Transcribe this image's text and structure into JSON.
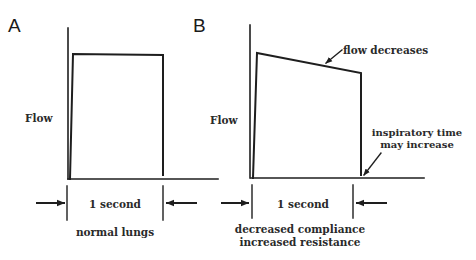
{
  "figure": {
    "panels": [
      {
        "id": "A",
        "letter": "A",
        "y_axis_label": "Flow",
        "duration_label": "1 second",
        "caption": "normal lungs",
        "waveform": "square"
      },
      {
        "id": "B",
        "letter": "B",
        "y_axis_label": "Flow",
        "duration_label": "1 second",
        "caption_lines": [
          "decreased compliance",
          "increased resistance"
        ],
        "waveform": "decelerating",
        "annotations": {
          "flow": "flow decreases",
          "time_lines": [
            "inspiratory time",
            "may increase"
          ]
        }
      }
    ],
    "colors": {
      "ink": "#1e1e1e",
      "background": "#ffffff"
    }
  }
}
